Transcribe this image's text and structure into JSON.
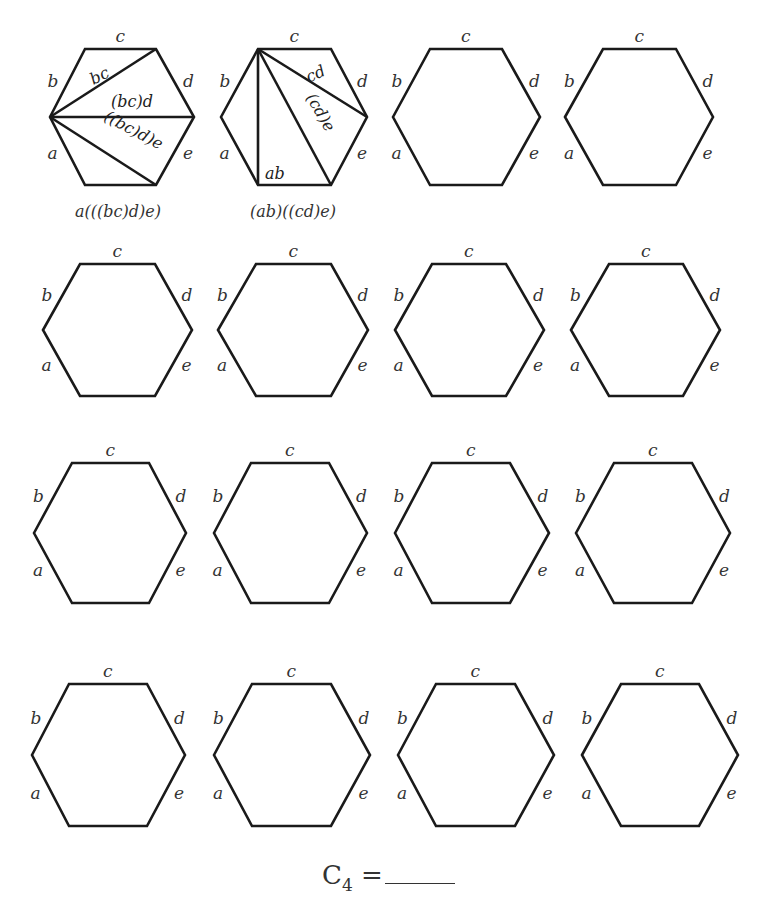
{
  "header": {
    "clipped_text_fragment": ""
  },
  "edge_labels": [
    "a",
    "b",
    "c",
    "d",
    "e"
  ],
  "hexagons": [
    {
      "row": 1,
      "col": 1,
      "filled": true,
      "caption": "a(((bc)d)e)",
      "inner_labels": [
        "bc",
        "(bc)d",
        "((bc)d)e"
      ]
    },
    {
      "row": 1,
      "col": 2,
      "filled": true,
      "caption": "(ab)((cd)e)",
      "inner_labels": [
        "cd",
        "(cd)e",
        "ab"
      ]
    },
    {
      "row": 1,
      "col": 3,
      "filled": false
    },
    {
      "row": 1,
      "col": 4,
      "filled": false
    },
    {
      "row": 2,
      "col": 1,
      "filled": false
    },
    {
      "row": 2,
      "col": 2,
      "filled": false
    },
    {
      "row": 2,
      "col": 3,
      "filled": false
    },
    {
      "row": 2,
      "col": 4,
      "filled": false
    },
    {
      "row": 3,
      "col": 1,
      "filled": false
    },
    {
      "row": 3,
      "col": 2,
      "filled": false
    },
    {
      "row": 3,
      "col": 3,
      "filled": false
    },
    {
      "row": 3,
      "col": 4,
      "filled": false
    },
    {
      "row": 4,
      "col": 1,
      "filled": false
    },
    {
      "row": 4,
      "col": 2,
      "filled": false
    },
    {
      "row": 4,
      "col": 3,
      "filled": false
    },
    {
      "row": 4,
      "col": 4,
      "filled": false
    }
  ],
  "footer": {
    "symbol": "C",
    "subscript": "4",
    "equals": " =",
    "answer": ""
  }
}
